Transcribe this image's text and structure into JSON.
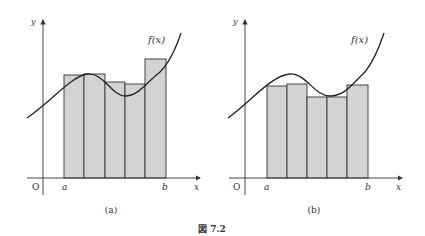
{
  "figure": {
    "caption": "図 7.2",
    "panels": [
      {
        "id": "a",
        "sublabel": "(a)",
        "function_label": "f(x)",
        "axis_y_label": "y",
        "axis_x_label": "x",
        "origin_label": "O",
        "a_label": "a",
        "b_label": "b",
        "description": "Upper Riemann sum: rectangles extend above the curve"
      },
      {
        "id": "b",
        "sublabel": "(b)",
        "function_label": "f(x)",
        "axis_y_label": "y",
        "axis_x_label": "x",
        "origin_label": "O",
        "a_label": "a",
        "b_label": "b",
        "description": "Lower Riemann sum: rectangles lie below the curve"
      }
    ]
  },
  "colors": {
    "bar_fill": "#d3d3d3",
    "bar_stroke": "#333333",
    "curve": "#222222",
    "axis": "#333333"
  }
}
